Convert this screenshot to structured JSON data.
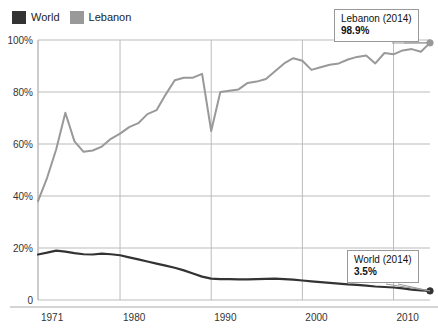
{
  "legend": {
    "items": [
      {
        "label": "World",
        "color": "#333333",
        "icon": "legend-swatch-icon"
      },
      {
        "label": "Lebanon",
        "color": "#999999",
        "icon": "legend-swatch-icon"
      }
    ]
  },
  "annotations": [
    {
      "id": "lebanon",
      "title": "Lebanon (2014)",
      "value": "98.9%"
    },
    {
      "id": "world",
      "title": "World (2014)",
      "value": "3.5%"
    }
  ],
  "axis": {
    "y_ticks": [
      "0",
      "20%",
      "40%",
      "60%",
      "80%",
      "100%"
    ],
    "x_ticks": [
      "1971",
      "1980",
      "1990",
      "2000",
      "2010"
    ]
  },
  "chart_data": {
    "type": "line",
    "title": "",
    "subtitle": "",
    "xlabel": "",
    "ylabel": "",
    "xlim": [
      1971,
      2014
    ],
    "ylim": [
      0,
      100
    ],
    "grid": true,
    "legend_position": "top-left",
    "x_tick_values": [
      1971,
      1980,
      1990,
      2000,
      2010
    ],
    "y_tick_values": [
      0,
      20,
      40,
      60,
      80,
      100
    ],
    "y_tick_labels": [
      "0",
      "20%",
      "40%",
      "60%",
      "80%",
      "100%"
    ],
    "x": [
      1971,
      1972,
      1973,
      1974,
      1975,
      1976,
      1977,
      1978,
      1979,
      1980,
      1981,
      1982,
      1983,
      1984,
      1985,
      1986,
      1987,
      1988,
      1989,
      1990,
      1991,
      1992,
      1993,
      1994,
      1995,
      1996,
      1997,
      1998,
      1999,
      2000,
      2001,
      2002,
      2003,
      2004,
      2005,
      2006,
      2007,
      2008,
      2009,
      2010,
      2011,
      2012,
      2013,
      2014
    ],
    "series": [
      {
        "name": "Lebanon",
        "color": "#999999",
        "end_marker": true,
        "end_label": "98.9%",
        "values": [
          38.0,
          47.0,
          58.0,
          72.0,
          61.0,
          57.0,
          57.5,
          59.0,
          62.0,
          64.0,
          66.5,
          68.0,
          71.5,
          73.0,
          79.0,
          84.5,
          85.5,
          85.5,
          87.0,
          65.0,
          80.0,
          80.5,
          81.0,
          83.5,
          84.0,
          85.0,
          88.0,
          91.0,
          93.0,
          92.0,
          88.5,
          89.5,
          90.5,
          91.0,
          92.5,
          93.5,
          94.0,
          91.0,
          95.0,
          94.5,
          96.0,
          96.5,
          95.5,
          98.9
        ]
      },
      {
        "name": "World",
        "color": "#333333",
        "end_marker": true,
        "end_label": "3.5%",
        "values": [
          17.5,
          18.2,
          19.0,
          18.6,
          18.0,
          17.6,
          17.5,
          17.8,
          17.6,
          17.2,
          16.4,
          15.6,
          14.8,
          14.0,
          13.2,
          12.4,
          11.4,
          10.2,
          9.0,
          8.2,
          8.0,
          8.0,
          7.9,
          7.9,
          8.0,
          8.1,
          8.2,
          8.0,
          7.8,
          7.5,
          7.2,
          6.9,
          6.6,
          6.3,
          6.0,
          5.8,
          5.5,
          5.2,
          5.0,
          4.8,
          4.5,
          4.0,
          3.7,
          3.5
        ]
      }
    ]
  }
}
